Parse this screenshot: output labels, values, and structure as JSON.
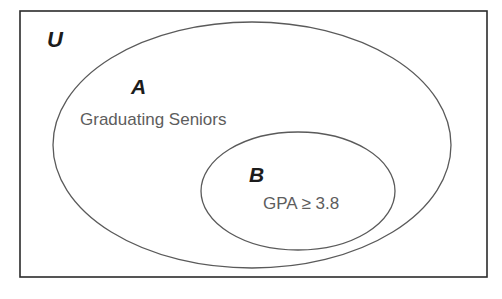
{
  "diagram": {
    "type": "euler-venn",
    "title": "",
    "background_color": "#ffffff",
    "universe": {
      "label": "U",
      "name": "universal-set",
      "shape": "rectangle",
      "stroke_color": "#2b2b2b",
      "fill_color": "#ffffff",
      "x": 20,
      "y": 11,
      "width": 467,
      "height": 266,
      "label_x": 47,
      "label_y": 47,
      "label_font_size": 22
    },
    "sets": [
      {
        "key": "A",
        "label": "A",
        "name": "set-a",
        "caption": "Graduating Seniors",
        "shape": "ellipse",
        "stroke_color": "#5a5a5a",
        "cx": 252,
        "cy": 145,
        "rx": 199,
        "ry": 123,
        "label_x": 131,
        "label_y": 94,
        "label_font_size": 21,
        "caption_x": 80,
        "caption_y": 125,
        "caption_font_size": 17
      },
      {
        "key": "B",
        "label": "B",
        "name": "set-b",
        "caption": "GPA ≥ 3.8",
        "shape": "ellipse",
        "stroke_color": "#5a5a5a",
        "cx": 298,
        "cy": 191,
        "rx": 97,
        "ry": 59,
        "label_x": 249,
        "label_y": 182,
        "label_font_size": 21,
        "caption_x": 263,
        "caption_y": 209,
        "caption_font_size": 17
      }
    ],
    "relationship": "B is a subset of A; A is a subset of U",
    "colors": {
      "universe_stroke": "#2b2b2b",
      "set_stroke": "#5a5a5a",
      "letter_text": "#1c1c1c",
      "caption_text": "#5d5d5d",
      "background": "#ffffff"
    }
  }
}
